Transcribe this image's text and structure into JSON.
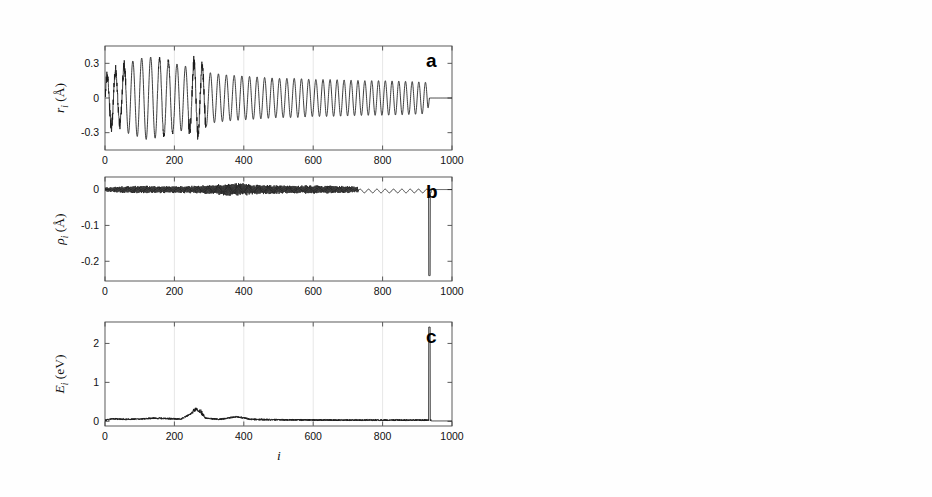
{
  "figure": {
    "background": "#fefefe",
    "trace_color": "#1b1b1b",
    "axis_color": "#4a4a4a",
    "grid_color": "#dddddd",
    "xlabel": "i",
    "panels_left": [
      "a",
      "b",
      "c"
    ],
    "panels_right": [
      "a",
      "b",
      "c",
      "d"
    ]
  },
  "chart_data": [
    {
      "id": "left-a",
      "type": "line",
      "panel_letter": "a",
      "title": "",
      "ylabel": "r_i (Å)",
      "ylabel_symbol": "r",
      "ylabel_sub": "i",
      "ylabel_unit": "(Å)",
      "xlabel": "i",
      "xlim": [
        0,
        1000
      ],
      "ylim": [
        -0.45,
        0.45
      ],
      "xticks": [
        0,
        200,
        400,
        600,
        800,
        1000
      ],
      "xticklabels": [
        "0",
        "200",
        "400",
        "600",
        "800",
        "1000"
      ],
      "yticks": [
        -0.3,
        0,
        0.3
      ],
      "yticklabels": [
        "-0.3",
        "0",
        "0.3"
      ],
      "grid": true,
      "description": "Damped oscillation, amplitude ~0.35 decaying to ~0.13, frequency increasing, flatlines to 0 after i=935",
      "envelope": [
        [
          0,
          0.16
        ],
        [
          20,
          0.26
        ],
        [
          40,
          0.22
        ],
        [
          60,
          0.3
        ],
        [
          90,
          0.33
        ],
        [
          120,
          0.36
        ],
        [
          160,
          0.34
        ],
        [
          200,
          0.3
        ],
        [
          240,
          0.27
        ],
        [
          265,
          0.33
        ],
        [
          300,
          0.22
        ],
        [
          350,
          0.2
        ],
        [
          400,
          0.19
        ],
        [
          450,
          0.18
        ],
        [
          500,
          0.17
        ],
        [
          550,
          0.17
        ],
        [
          600,
          0.16
        ],
        [
          650,
          0.16
        ],
        [
          700,
          0.155
        ],
        [
          750,
          0.15
        ],
        [
          800,
          0.15
        ],
        [
          860,
          0.145
        ],
        [
          900,
          0.14
        ],
        [
          930,
          0.135
        ],
        [
          935,
          0.0
        ],
        [
          1000,
          0.0
        ]
      ],
      "period_profile": [
        [
          0,
          24
        ],
        [
          120,
          26
        ],
        [
          260,
          24
        ],
        [
          400,
          22
        ],
        [
          700,
          20
        ],
        [
          930,
          19
        ]
      ],
      "noise_bands": [
        [
          0,
          60,
          0.05
        ],
        [
          240,
          290,
          0.06
        ],
        [
          150,
          200,
          0.02
        ]
      ],
      "cutoff": 935
    },
    {
      "id": "left-b",
      "type": "line",
      "panel_letter": "b",
      "ylabel": "rho_i (Å)",
      "ylabel_symbol": "ρ",
      "ylabel_sub": "i",
      "ylabel_unit": "(Å)",
      "xlabel": "i",
      "xlim": [
        0,
        1000
      ],
      "ylim": [
        -0.255,
        0.035
      ],
      "xticks": [
        0,
        200,
        400,
        600,
        800,
        1000
      ],
      "xticklabels": [
        "0",
        "200",
        "400",
        "600",
        "800",
        "1000"
      ],
      "yticks": [
        -0.2,
        -0.1,
        0
      ],
      "yticklabels": [
        "-0.2",
        "-0.1",
        "0"
      ],
      "grid": true,
      "description": "Dense noise band around 0 with amplitude ~0.012, broadening near i=380, smooth slow ripples from i=730, sharp negative spike to -0.24 at i=935",
      "noise_envelope": [
        [
          0,
          0.006
        ],
        [
          50,
          0.01
        ],
        [
          100,
          0.011
        ],
        [
          150,
          0.01
        ],
        [
          200,
          0.01
        ],
        [
          250,
          0.011
        ],
        [
          300,
          0.013
        ],
        [
          360,
          0.018
        ],
        [
          390,
          0.02
        ],
        [
          430,
          0.014
        ],
        [
          480,
          0.013
        ],
        [
          540,
          0.012
        ],
        [
          600,
          0.012
        ],
        [
          660,
          0.011
        ],
        [
          700,
          0.01
        ],
        [
          730,
          0.008
        ],
        [
          760,
          0.006
        ],
        [
          800,
          0.006
        ],
        [
          870,
          0.006
        ],
        [
          930,
          0.005
        ]
      ],
      "spike": {
        "x": 935,
        "y": -0.24
      },
      "cutoff": 940
    },
    {
      "id": "left-c",
      "type": "line",
      "panel_letter": "c",
      "ylabel": "E_i (eV)",
      "ylabel_symbol": "E",
      "ylabel_sub": "i",
      "ylabel_unit": "(eV)",
      "xlabel": "i",
      "xlim": [
        0,
        1000
      ],
      "ylim": [
        -0.12,
        2.55
      ],
      "xticks": [
        0,
        200,
        400,
        600,
        800,
        1000
      ],
      "xticklabels": [
        "0",
        "200",
        "400",
        "600",
        "800",
        "1000"
      ],
      "yticks": [
        0,
        1,
        2
      ],
      "yticklabels": [
        "0",
        "1",
        "2"
      ],
      "grid": true,
      "description": "Near-zero baseline with small bumps, local peak ~0.28 at i=270, small bump ~0.12 at i=385, tall spike to 2.42 at i=935",
      "baseline": [
        [
          0,
          0.02
        ],
        [
          20,
          0.07
        ],
        [
          60,
          0.05
        ],
        [
          100,
          0.06
        ],
        [
          140,
          0.08
        ],
        [
          180,
          0.07
        ],
        [
          220,
          0.06
        ],
        [
          265,
          0.28
        ],
        [
          290,
          0.08
        ],
        [
          330,
          0.05
        ],
        [
          380,
          0.12
        ],
        [
          420,
          0.05
        ],
        [
          500,
          0.04
        ],
        [
          600,
          0.035
        ],
        [
          700,
          0.03
        ],
        [
          800,
          0.03
        ],
        [
          900,
          0.03
        ],
        [
          930,
          0.03
        ]
      ],
      "spike": {
        "x": 935,
        "y": 2.42
      },
      "cutoff": 940
    },
    {
      "id": "right-a",
      "type": "line",
      "panel_letter": "a",
      "ylabel": "r_i (Å)",
      "ylabel_symbol": "r",
      "ylabel_sub": "i",
      "ylabel_unit": "(Å)",
      "xlabel": "i",
      "xlim": [
        0,
        1000
      ],
      "ylim": [
        -0.029,
        0.029
      ],
      "xticks": [
        0,
        200,
        400,
        600,
        800,
        1000
      ],
      "xticklabels": [
        "0",
        "200",
        "400",
        "600",
        "800",
        "1000"
      ],
      "yticks": [
        -0.02,
        0,
        0.02
      ],
      "yticklabels": [
        "-0.02",
        "0",
        "0.02"
      ],
      "grid": true,
      "description": "Irregular high-frequency oscillation up to 0.023 for i<120, quieter regular oscillation ~0.008 mid-range growing to ~0.018 near i=700-770, flatlines to 0 after i=780",
      "envelope": [
        [
          0,
          0.004
        ],
        [
          15,
          0.012
        ],
        [
          30,
          0.023
        ],
        [
          50,
          0.013
        ],
        [
          70,
          0.019
        ],
        [
          90,
          0.022
        ],
        [
          105,
          0.012
        ],
        [
          130,
          0.01
        ],
        [
          160,
          0.008
        ],
        [
          200,
          0.006
        ],
        [
          240,
          0.006
        ],
        [
          280,
          0.008
        ],
        [
          320,
          0.009
        ],
        [
          380,
          0.009
        ],
        [
          440,
          0.01
        ],
        [
          500,
          0.011
        ],
        [
          560,
          0.011
        ],
        [
          620,
          0.012
        ],
        [
          670,
          0.016
        ],
        [
          700,
          0.019
        ],
        [
          730,
          0.014
        ],
        [
          755,
          0.017
        ],
        [
          775,
          0.012
        ],
        [
          780,
          0.0
        ],
        [
          1000,
          0.0
        ]
      ],
      "period_profile": [
        [
          0,
          7
        ],
        [
          100,
          9
        ],
        [
          200,
          12
        ],
        [
          400,
          16
        ],
        [
          600,
          17
        ],
        [
          775,
          15
        ]
      ],
      "cutoff": 780
    },
    {
      "id": "right-b",
      "type": "line",
      "panel_letter": "b",
      "ylabel": "phi_{i+1} - phi_i",
      "ylabel_symbol": "φ",
      "ylabel_sub": "i+1",
      "ylabel_sub2": "i",
      "ylabel_unit": "",
      "xlabel": "i",
      "xlim": [
        0,
        1000
      ],
      "ylim": [
        -0.0125,
        0.0125
      ],
      "xticks": [
        0,
        200,
        400,
        600,
        800,
        1000
      ],
      "xticklabels": [
        "0",
        "200",
        "400",
        "600",
        "800",
        "1000"
      ],
      "yticks": [
        -0.01,
        0,
        0.01
      ],
      "yticklabels": [
        "-0.01",
        "0",
        "0.01"
      ],
      "grid": true,
      "description": "Growing oscillation envelope from ~0 at i=0 to ~0.006 at i=400, narrowing then sharp burst to ±0.01 near i=500, single deep negative excursion to -0.0095 at i=505, flatlines to 0 after i=520",
      "envelope": [
        [
          0,
          0.0001
        ],
        [
          40,
          0.0006
        ],
        [
          80,
          0.001
        ],
        [
          120,
          0.0016
        ],
        [
          160,
          0.0022
        ],
        [
          200,
          0.0028
        ],
        [
          240,
          0.0034
        ],
        [
          280,
          0.004
        ],
        [
          320,
          0.0048
        ],
        [
          360,
          0.0056
        ],
        [
          390,
          0.0062
        ],
        [
          410,
          0.005
        ],
        [
          430,
          0.0036
        ],
        [
          450,
          0.0042
        ],
        [
          470,
          0.0062
        ],
        [
          490,
          0.009
        ],
        [
          500,
          0.0098
        ],
        [
          508,
          0.006
        ],
        [
          515,
          0.002
        ],
        [
          520,
          0.0
        ],
        [
          1000,
          0.0
        ]
      ],
      "period_profile": [
        [
          0,
          6
        ],
        [
          200,
          6
        ],
        [
          400,
          5
        ],
        [
          500,
          4
        ]
      ],
      "deep_spike": {
        "x": 505,
        "y": -0.0095
      },
      "cutoff": 520
    },
    {
      "id": "right-c",
      "type": "line",
      "panel_letter": "c",
      "ylabel": "rho_i (Å)",
      "ylabel_symbol": "ρ",
      "ylabel_sub": "i",
      "ylabel_unit": "(Å)",
      "xlabel": "i",
      "xlim": [
        0,
        1000
      ],
      "ylim": [
        -0.029,
        0.029
      ],
      "xticks": [
        0,
        200,
        400,
        600,
        800,
        1000
      ],
      "xticklabels": [
        "0",
        "200",
        "400",
        "600",
        "800",
        "1000"
      ],
      "yticks": [
        -0.02,
        0,
        0.02
      ],
      "yticklabels": [
        "-0.02",
        "0",
        "0.02"
      ],
      "grid": true,
      "description": "Dense high-frequency noise band peaking ~0.018 at i=80-110, narrowing to ~0.007 mid-range, re-broadening ~0.014 near i=500, discrete beats i=600-780 with final swing to -0.019 at i=775, flat 0 after i=800",
      "envelope": [
        [
          0,
          0.002
        ],
        [
          30,
          0.009
        ],
        [
          60,
          0.016
        ],
        [
          90,
          0.018
        ],
        [
          115,
          0.014
        ],
        [
          140,
          0.011
        ],
        [
          170,
          0.009
        ],
        [
          210,
          0.008
        ],
        [
          260,
          0.007
        ],
        [
          310,
          0.008
        ],
        [
          360,
          0.008
        ],
        [
          400,
          0.009
        ],
        [
          450,
          0.01
        ],
        [
          490,
          0.015
        ],
        [
          515,
          0.012
        ],
        [
          550,
          0.01
        ],
        [
          590,
          0.011
        ],
        [
          630,
          0.01
        ],
        [
          670,
          0.011
        ],
        [
          700,
          0.01
        ],
        [
          730,
          0.014
        ],
        [
          760,
          0.013
        ],
        [
          775,
          0.019
        ],
        [
          795,
          0.004
        ],
        [
          800,
          0.0
        ],
        [
          1000,
          0.0
        ]
      ],
      "period_profile": [
        [
          0,
          4
        ],
        [
          150,
          4.5
        ],
        [
          400,
          5
        ],
        [
          600,
          9
        ],
        [
          720,
          14
        ],
        [
          795,
          16
        ]
      ],
      "cutoff": 800
    },
    {
      "id": "right-d",
      "type": "line",
      "panel_letter": "d",
      "ylabel": "E_i (eV)",
      "ylabel_symbol": "E",
      "ylabel_sub": "i",
      "ylabel_unit": "(eV)",
      "xlabel": "i",
      "xlim": [
        0,
        1000
      ],
      "ylim": [
        -0.008,
        0.088
      ],
      "xticks": [
        0,
        200,
        400,
        600,
        800,
        1000
      ],
      "xticklabels": [
        "0",
        "200",
        "400",
        "600",
        "800",
        "1000"
      ],
      "yticks": [
        0,
        0.04,
        0.08
      ],
      "yticklabels": [
        "0",
        "0.04",
        "0.08"
      ],
      "grid": true,
      "description": "Noisy baseline near 0 with band up to 0.018 for i<130, bump ~0.018 at i=390, rising ramp to sharp peak 0.081 at i=500, decay, small ripples i=700-760, narrow spike 0.015 at i=775, flat 0 after i=790",
      "upper_envelope": [
        [
          0,
          0.002
        ],
        [
          30,
          0.014
        ],
        [
          60,
          0.018
        ],
        [
          95,
          0.017
        ],
        [
          130,
          0.013
        ],
        [
          170,
          0.01
        ],
        [
          210,
          0.01
        ],
        [
          260,
          0.009
        ],
        [
          310,
          0.01
        ],
        [
          350,
          0.012
        ],
        [
          385,
          0.018
        ],
        [
          405,
          0.013
        ],
        [
          430,
          0.01
        ],
        [
          455,
          0.022
        ],
        [
          475,
          0.038
        ],
        [
          492,
          0.056
        ],
        [
          500,
          0.081
        ],
        [
          508,
          0.03
        ],
        [
          515,
          0.01
        ],
        [
          545,
          0.007
        ],
        [
          600,
          0.006
        ],
        [
          650,
          0.006
        ],
        [
          700,
          0.007
        ],
        [
          725,
          0.01
        ],
        [
          750,
          0.009
        ],
        [
          775,
          0.015
        ],
        [
          788,
          0.002
        ],
        [
          792,
          0.0
        ],
        [
          1000,
          0.0
        ]
      ],
      "cutoff": 792
    }
  ]
}
